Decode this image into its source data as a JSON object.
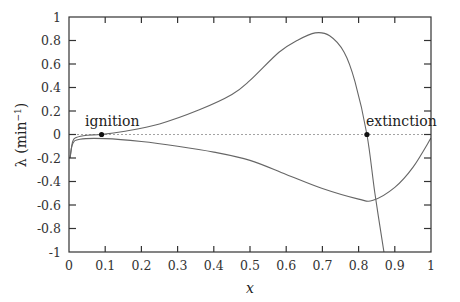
{
  "chart_data": {
    "type": "line",
    "title": "",
    "xlabel": "x",
    "ylabel": "λ (min⁻¹)",
    "xlim": [
      0,
      1
    ],
    "ylim": [
      -1,
      1
    ],
    "grid": false,
    "legend": null,
    "xticks": [
      "0",
      "0.1",
      "0.2",
      "0.3",
      "0.4",
      "0.5",
      "0.6",
      "0.7",
      "0.8",
      "0.9",
      "1"
    ],
    "yticks": [
      "1",
      "0.8",
      "0.6",
      "0.4",
      "0.2",
      "0",
      "-0.2",
      "-0.4",
      "-0.6",
      "-0.8",
      "-1"
    ],
    "reference_line": {
      "y": 0,
      "style": "dotted"
    },
    "series": [
      {
        "name": "upper eigenvalue",
        "x": [
          0.003,
          0.01,
          0.02,
          0.05,
          0.09,
          0.15,
          0.25,
          0.36,
          0.45,
          0.5,
          0.58,
          0.63,
          0.68,
          0.72,
          0.76,
          0.79,
          0.823,
          0.845,
          0.87
        ],
        "y": [
          -0.2,
          -0.06,
          -0.025,
          -0.006,
          0.0,
          0.025,
          0.09,
          0.21,
          0.34,
          0.46,
          0.7,
          0.8,
          0.865,
          0.84,
          0.7,
          0.45,
          0.0,
          -0.5,
          -1.0
        ]
      },
      {
        "name": "lower eigenvalue",
        "x": [
          0.003,
          0.01,
          0.03,
          0.1,
          0.2,
          0.3,
          0.4,
          0.5,
          0.6,
          0.7,
          0.8,
          0.84,
          0.9,
          0.95,
          1.0
        ],
        "y": [
          -0.2,
          -0.08,
          -0.04,
          -0.035,
          -0.06,
          -0.1,
          -0.15,
          -0.22,
          -0.34,
          -0.46,
          -0.55,
          -0.56,
          -0.45,
          -0.28,
          -0.03
        ]
      }
    ],
    "annotations": [
      {
        "text": "ignition",
        "x": 0.09,
        "y": 0.0,
        "marker": "dot"
      },
      {
        "text": "extinction",
        "x": 0.823,
        "y": 0.0,
        "marker": "dot"
      }
    ]
  },
  "labels": {
    "xlabel": "x",
    "ylabel_lambda": "λ",
    "ylabel_unit_open": " (min",
    "ylabel_exp": "−1",
    "ylabel_unit_close": ")",
    "ignition": "ignition",
    "extinction": "extinction"
  }
}
